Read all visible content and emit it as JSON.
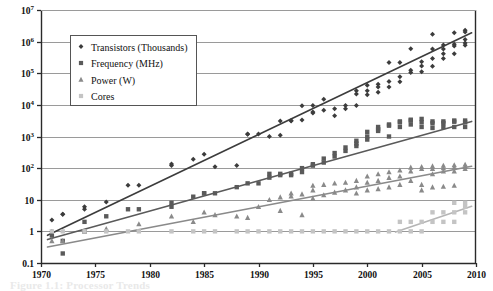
{
  "chart_data": {
    "type": "scatter",
    "title": "",
    "xlabel": "",
    "ylabel": "",
    "log_y": true,
    "grid": true,
    "legend_position": "top-left-inside",
    "xlim": [
      1970,
      2010
    ],
    "ylim": [
      0.1,
      10000000
    ],
    "x_ticks": [
      1970,
      1975,
      1980,
      1985,
      1990,
      1995,
      2000,
      2005,
      2010
    ],
    "x_tick_labels": [
      "1970",
      "1975",
      "1980",
      "1985",
      "1990",
      "1995",
      "2000",
      "2005",
      "2010"
    ],
    "y_ticks": [
      0.1,
      1,
      10,
      100,
      1000,
      10000,
      100000,
      1000000,
      10000000
    ],
    "y_tick_labels": [
      "0.1",
      "1",
      "10",
      "10^2",
      "10^3",
      "10^4",
      "10^5",
      "10^6",
      "10^7"
    ],
    "y_tick_bases": [
      "0.1",
      "1",
      "10",
      "10",
      "10",
      "10",
      "10",
      "10",
      "10"
    ],
    "y_tick_exponents": [
      "",
      "",
      "",
      "2",
      "3",
      "4",
      "5",
      "6",
      "7"
    ],
    "series": [
      {
        "name": "Transistors (Thousands)",
        "marker": "diamond",
        "color": "#3c3c3c",
        "trend_color": "#3c3c3c",
        "trend": [
          [
            1970.6,
            0.75
          ],
          [
            2009.6,
            1900000
          ]
        ],
        "points": [
          [
            1971,
            2.3
          ],
          [
            1971,
            1.0
          ],
          [
            1972,
            3.5
          ],
          [
            1972,
            3.5
          ],
          [
            1974,
            6.0
          ],
          [
            1974,
            5.0
          ],
          [
            1976,
            8.5
          ],
          [
            1978,
            29
          ],
          [
            1979,
            29
          ],
          [
            1982,
            134
          ],
          [
            1982,
            120
          ],
          [
            1984,
            190
          ],
          [
            1985,
            275
          ],
          [
            1986,
            110
          ],
          [
            1988,
            120
          ],
          [
            1989,
            1180
          ],
          [
            1989,
            1200
          ],
          [
            1990,
            1200
          ],
          [
            1991,
            1000
          ],
          [
            1992,
            1100
          ],
          [
            1992,
            3100
          ],
          [
            1993,
            3100
          ],
          [
            1993,
            3200
          ],
          [
            1994,
            3300
          ],
          [
            1994,
            9300
          ],
          [
            1995,
            5500
          ],
          [
            1995,
            9500
          ],
          [
            1995,
            6000
          ],
          [
            1996,
            6800
          ],
          [
            1996,
            15000
          ],
          [
            1997,
            7500
          ],
          [
            1997,
            4500
          ],
          [
            1998,
            9500
          ],
          [
            1998,
            7500
          ],
          [
            1999,
            22000
          ],
          [
            1999,
            9500
          ],
          [
            1999,
            28000
          ],
          [
            2000,
            42000
          ],
          [
            2000,
            28000
          ],
          [
            2000,
            21000
          ],
          [
            2001,
            25000
          ],
          [
            2001,
            45000
          ],
          [
            2001,
            37000
          ],
          [
            2002,
            55000
          ],
          [
            2002,
            220000
          ],
          [
            2002,
            37000
          ],
          [
            2003,
            77000
          ],
          [
            2003,
            220000
          ],
          [
            2003,
            54000
          ],
          [
            2004,
            125000
          ],
          [
            2004,
            592000
          ],
          [
            2004,
            106000
          ],
          [
            2005,
            169000
          ],
          [
            2005,
            230000
          ],
          [
            2005,
            112000
          ],
          [
            2006,
            291000
          ],
          [
            2006,
            582000
          ],
          [
            2006,
            167000
          ],
          [
            2006,
            1720000
          ],
          [
            2007,
            582000
          ],
          [
            2007,
            789000
          ],
          [
            2007,
            291000
          ],
          [
            2007,
            410000
          ],
          [
            2008,
            731000
          ],
          [
            2008,
            1900000
          ],
          [
            2008,
            410000
          ],
          [
            2008,
            820000
          ],
          [
            2009,
            904000
          ],
          [
            2009,
            2300000
          ],
          [
            2009,
            774000
          ],
          [
            2009,
            1170000
          ],
          [
            2009,
            2000000
          ]
        ]
      },
      {
        "name": "Frequency (MHz)",
        "marker": "square",
        "color": "#5a5a5a",
        "trend_color": "#5a5a5a",
        "trend": [
          [
            1970.6,
            0.55
          ],
          [
            2009.6,
            3000
          ]
        ],
        "points": [
          [
            1971,
            0.74
          ],
          [
            1972,
            0.5
          ],
          [
            1972,
            0.2
          ],
          [
            1974,
            2.0
          ],
          [
            1974,
            1.0
          ],
          [
            1976,
            3.0
          ],
          [
            1978,
            5.0
          ],
          [
            1979,
            5.0
          ],
          [
            1982,
            6.0
          ],
          [
            1982,
            8.0
          ],
          [
            1984,
            12.5
          ],
          [
            1985,
            16
          ],
          [
            1985,
            16
          ],
          [
            1986,
            16
          ],
          [
            1988,
            25
          ],
          [
            1989,
            33
          ],
          [
            1990,
            33
          ],
          [
            1991,
            50
          ],
          [
            1991,
            66
          ],
          [
            1992,
            60
          ],
          [
            1992,
            66
          ],
          [
            1993,
            60
          ],
          [
            1993,
            66
          ],
          [
            1994,
            75
          ],
          [
            1994,
            100
          ],
          [
            1995,
            120
          ],
          [
            1995,
            133
          ],
          [
            1996,
            150
          ],
          [
            1996,
            200
          ],
          [
            1997,
            233
          ],
          [
            1997,
            300
          ],
          [
            1998,
            350
          ],
          [
            1998,
            450
          ],
          [
            1999,
            500
          ],
          [
            1999,
            600
          ],
          [
            1999,
            733
          ],
          [
            2000,
            800
          ],
          [
            2000,
            1000
          ],
          [
            2000,
            1400
          ],
          [
            2001,
            1500
          ],
          [
            2001,
            1700
          ],
          [
            2001,
            2000
          ],
          [
            2002,
            2200
          ],
          [
            2002,
            2400
          ],
          [
            2002,
            1000
          ],
          [
            2003,
            3000
          ],
          [
            2003,
            2800
          ],
          [
            2003,
            2000
          ],
          [
            2004,
            3400
          ],
          [
            2004,
            3200
          ],
          [
            2004,
            2400
          ],
          [
            2005,
            3600
          ],
          [
            2005,
            2800
          ],
          [
            2005,
            2000
          ],
          [
            2006,
            3000
          ],
          [
            2006,
            2600
          ],
          [
            2006,
            1860
          ],
          [
            2007,
            3000
          ],
          [
            2007,
            2660
          ],
          [
            2007,
            2000
          ],
          [
            2008,
            3200
          ],
          [
            2008,
            2930
          ],
          [
            2008,
            2000
          ],
          [
            2009,
            3200
          ],
          [
            2009,
            2800
          ],
          [
            2009,
            2000
          ]
        ]
      },
      {
        "name": "Power (W)",
        "marker": "triangle",
        "color": "#8a8a8a",
        "trend_color": "#8a8a8a",
        "trend": [
          [
            1970.6,
            0.32
          ],
          [
            2009.6,
            115
          ]
        ],
        "points": [
          [
            1971,
            0.5
          ],
          [
            1972,
            0.5
          ],
          [
            1974,
            1.0
          ],
          [
            1976,
            1.2
          ],
          [
            1979,
            1.7
          ],
          [
            1982,
            3.0
          ],
          [
            1984,
            2.0
          ],
          [
            1985,
            4.0
          ],
          [
            1986,
            3.3
          ],
          [
            1988,
            3.0
          ],
          [
            1989,
            2.7
          ],
          [
            1990,
            6.0
          ],
          [
            1991,
            10
          ],
          [
            1992,
            12
          ],
          [
            1992,
            4.5
          ],
          [
            1993,
            13
          ],
          [
            1993,
            16
          ],
          [
            1994,
            15
          ],
          [
            1994,
            3.3
          ],
          [
            1995,
            20
          ],
          [
            1995,
            28
          ],
          [
            1995,
            11
          ],
          [
            1996,
            30
          ],
          [
            1996,
            14
          ],
          [
            1997,
            33
          ],
          [
            1997,
            17
          ],
          [
            1998,
            35
          ],
          [
            1998,
            20
          ],
          [
            1999,
            40
          ],
          [
            1999,
            25
          ],
          [
            1999,
            16
          ],
          [
            2000,
            55
          ],
          [
            2000,
            35
          ],
          [
            2000,
            20
          ],
          [
            2001,
            65
          ],
          [
            2001,
            40
          ],
          [
            2001,
            22
          ],
          [
            2002,
            75
          ],
          [
            2002,
            50
          ],
          [
            2002,
            25
          ],
          [
            2003,
            85
          ],
          [
            2003,
            55
          ],
          [
            2003,
            30
          ],
          [
            2004,
            105
          ],
          [
            2004,
            80
          ],
          [
            2004,
            40
          ],
          [
            2005,
            110
          ],
          [
            2005,
            95
          ],
          [
            2005,
            30
          ],
          [
            2005,
            20
          ],
          [
            2006,
            115
          ],
          [
            2006,
            95
          ],
          [
            2006,
            65
          ],
          [
            2006,
            25
          ],
          [
            2007,
            120
          ],
          [
            2007,
            100
          ],
          [
            2007,
            80
          ],
          [
            2007,
            26
          ],
          [
            2008,
            125
          ],
          [
            2008,
            105
          ],
          [
            2008,
            80
          ],
          [
            2008,
            28
          ],
          [
            2009,
            130
          ],
          [
            2009,
            110
          ],
          [
            2009,
            95
          ]
        ]
      },
      {
        "name": "Cores",
        "marker": "square-light",
        "color": "#c4c4c4",
        "trend_color": "#b5b5b5",
        "trend": [
          [
            2002.6,
            0.95
          ],
          [
            2009.6,
            6.2
          ]
        ],
        "points": [
          [
            1971,
            1
          ],
          [
            1972,
            1
          ],
          [
            1974,
            1
          ],
          [
            1976,
            1
          ],
          [
            1978,
            1
          ],
          [
            1979,
            1
          ],
          [
            1982,
            1
          ],
          [
            1984,
            1
          ],
          [
            1985,
            1
          ],
          [
            1986,
            1
          ],
          [
            1988,
            1
          ],
          [
            1989,
            1
          ],
          [
            1990,
            1
          ],
          [
            1991,
            1
          ],
          [
            1992,
            1
          ],
          [
            1993,
            1
          ],
          [
            1994,
            1
          ],
          [
            1995,
            1
          ],
          [
            1996,
            1
          ],
          [
            1997,
            1
          ],
          [
            1998,
            1
          ],
          [
            1999,
            1
          ],
          [
            2000,
            1
          ],
          [
            2001,
            1
          ],
          [
            2002,
            1
          ],
          [
            2003,
            1
          ],
          [
            2003,
            2
          ],
          [
            2004,
            1
          ],
          [
            2004,
            2
          ],
          [
            2005,
            1
          ],
          [
            2005,
            2
          ],
          [
            2006,
            2
          ],
          [
            2006,
            4
          ],
          [
            2007,
            2
          ],
          [
            2007,
            4
          ],
          [
            2008,
            2
          ],
          [
            2008,
            4
          ],
          [
            2008,
            8
          ],
          [
            2009,
            4
          ],
          [
            2009,
            6
          ],
          [
            2009,
            8
          ]
        ]
      }
    ],
    "legend": [
      {
        "label": "Transistors (Thousands)",
        "marker": "diamond",
        "color": "#3c3c3c"
      },
      {
        "label": "Frequency (MHz)",
        "marker": "square",
        "color": "#5a5a5a"
      },
      {
        "label": "Power (W)",
        "marker": "triangle",
        "color": "#8a8a8a"
      },
      {
        "label": "Cores",
        "marker": "square-light",
        "color": "#c4c4c4"
      }
    ]
  },
  "caption": {
    "text": "Figure 1.1:  Processor  Trends"
  },
  "colors": {
    "axis": "#2a2a2a",
    "grid": "#9a9a9a",
    "background": "#ffffff",
    "legend_border": "#555555",
    "text": "#111111"
  }
}
